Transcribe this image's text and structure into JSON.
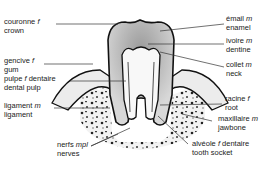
{
  "diagram": {
    "labels": [
      {
        "id": "crown",
        "fr": "couronne",
        "gender": "f",
        "en": "crown"
      },
      {
        "id": "gum",
        "fr": "gencive",
        "gender": "f",
        "en": "gum"
      },
      {
        "id": "dental-pulp",
        "fr": "pulpe",
        "gender": "f",
        "fr_suffix": "dentaire",
        "en": "dental pulp"
      },
      {
        "id": "ligament",
        "fr": "ligament",
        "gender": "m",
        "en": "ligament"
      },
      {
        "id": "nerves",
        "fr": "nerfs",
        "gender": "mpl",
        "en": "nerves"
      },
      {
        "id": "enamel",
        "fr": "émail",
        "gender": "m",
        "en": "enamel"
      },
      {
        "id": "dentine",
        "fr": "ivoire",
        "gender": "m",
        "en": "dentine"
      },
      {
        "id": "neck",
        "fr": "collet",
        "gender": "m",
        "en": "neck"
      },
      {
        "id": "root",
        "fr": "racine",
        "gender": "f",
        "en": "root"
      },
      {
        "id": "jawbone",
        "fr": "maxillaire",
        "gender": "m",
        "en": "jawbone"
      },
      {
        "id": "tooth-socket",
        "fr": "alvéole",
        "gender": "f",
        "fr_suffix": "dentaire",
        "en": "tooth socket"
      }
    ]
  }
}
